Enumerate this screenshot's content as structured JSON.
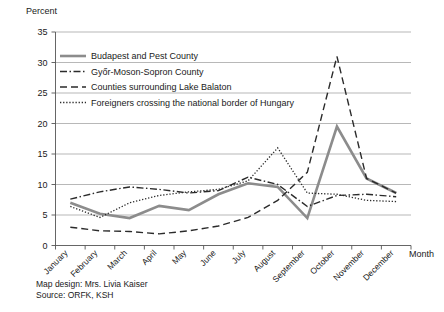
{
  "chart_data": {
    "type": "line",
    "title": "",
    "xlabel": "Month",
    "ylabel": "Percent",
    "ylim": [
      0,
      35
    ],
    "yticks": [
      0,
      5,
      10,
      15,
      20,
      25,
      30,
      35
    ],
    "grid": true,
    "legend_position": "top-left-inside",
    "categories": [
      "January",
      "February",
      "March",
      "April",
      "May",
      "June",
      "July",
      "August",
      "September",
      "October",
      "November",
      "December"
    ],
    "series": [
      {
        "name": "Budapest and Pest County",
        "style": "solid",
        "color": "#8c8c8c",
        "values": [
          7.0,
          5.2,
          4.5,
          6.5,
          5.8,
          8.4,
          10.2,
          9.6,
          4.5,
          19.5,
          11.0,
          8.6
        ]
      },
      {
        "name": "Győr-Moson-Sopron County",
        "style": "dash-dot",
        "color": "#2b2b2b",
        "values": [
          7.6,
          8.8,
          9.6,
          9.2,
          8.6,
          9.0,
          11.2,
          10.0,
          6.4,
          8.2,
          8.4,
          8.0
        ]
      },
      {
        "name": "Counties surrounding Lake Balaton",
        "style": "long-dash",
        "color": "#2b2b2b",
        "values": [
          3.0,
          2.4,
          2.3,
          1.9,
          2.4,
          3.2,
          4.6,
          7.4,
          12.0,
          31.0,
          11.0,
          8.6
        ]
      },
      {
        "name": "Foreigners crossing the national border of Hungary",
        "style": "dotted",
        "color": "#2b2b2b",
        "values": [
          6.4,
          4.6,
          7.0,
          8.2,
          8.8,
          9.2,
          10.6,
          16.0,
          8.6,
          8.4,
          7.4,
          7.2
        ]
      }
    ]
  },
  "axis": {
    "y_title": "Percent",
    "x_title": "Month",
    "y_tick_labels": [
      "0",
      "5",
      "10",
      "15",
      "20",
      "25",
      "30",
      "35"
    ],
    "x_tick_labels": [
      "January",
      "February",
      "March",
      "April",
      "May",
      "June",
      "July",
      "August",
      "September",
      "October",
      "November",
      "December"
    ]
  },
  "legend": {
    "items": [
      {
        "label": "Budapest and Pest County",
        "style": "solid"
      },
      {
        "label": "Győr-Moson-Sopron County",
        "style": "dash-dot"
      },
      {
        "label": "Counties surrounding Lake Balaton",
        "style": "long-dash"
      },
      {
        "label": "Foreigners crossing the national border of Hungary",
        "style": "dotted"
      }
    ]
  },
  "footer": {
    "line1": "Map design: Mrs. Livia Kaiser",
    "line2": "Source: ORFK, KSH"
  }
}
